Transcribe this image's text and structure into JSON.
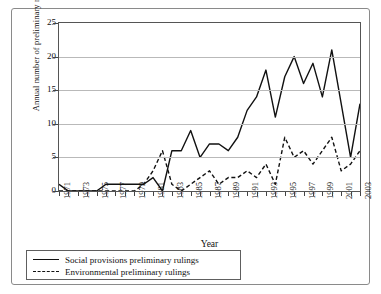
{
  "chart_data": {
    "type": "line",
    "title": "",
    "xlabel": "Year",
    "ylabel": "Annual number of preliminary rulings",
    "xlim": [
      1971,
      2003
    ],
    "ylim": [
      0,
      25
    ],
    "ytick_labels": [
      "0",
      "5",
      "10",
      "15",
      "20",
      "25"
    ],
    "ytick_values": [
      0,
      5,
      10,
      15,
      20,
      25
    ],
    "grid": "horizontal",
    "legend_position": "below-left",
    "x": [
      1971,
      1972,
      1973,
      1974,
      1975,
      1976,
      1977,
      1978,
      1979,
      1980,
      1981,
      1982,
      1983,
      1984,
      1985,
      1986,
      1987,
      1988,
      1989,
      1990,
      1991,
      1992,
      1993,
      1994,
      1995,
      1996,
      1997,
      1998,
      1999,
      2000,
      2001,
      2002,
      2003
    ],
    "xtick_labels": [
      "1971",
      "1973",
      "1975",
      "1977",
      "1979",
      "1981",
      "1983",
      "1985",
      "1987",
      "1989",
      "1991",
      "1993",
      "1995",
      "1997",
      "1999",
      "2001",
      "2003"
    ],
    "series": [
      {
        "name": "Social provisions preliminary rulings",
        "style": "solid",
        "color": "#111111",
        "values": [
          1,
          0,
          0,
          0,
          0,
          1,
          1,
          1,
          1,
          1,
          2,
          0,
          6,
          6,
          9,
          5,
          7,
          7,
          6,
          8,
          12,
          14,
          18,
          11,
          17,
          20,
          16,
          19,
          14,
          21,
          13,
          5,
          13
        ]
      },
      {
        "name": "Environmental preliminary rulings",
        "style": "dashed",
        "color": "#111111",
        "values": [
          0,
          0,
          0,
          0,
          0,
          0,
          0,
          0,
          0,
          1,
          3,
          6,
          1,
          0,
          1,
          2,
          3,
          1,
          2,
          2,
          3,
          2,
          4,
          1,
          8,
          5,
          6,
          4,
          6,
          8,
          3,
          4,
          6
        ]
      }
    ]
  },
  "legend": {
    "items": [
      {
        "label": "Social provisions preliminary rulings",
        "style": "solid"
      },
      {
        "label": "Environmental preliminary rulings",
        "style": "dashed"
      }
    ]
  }
}
